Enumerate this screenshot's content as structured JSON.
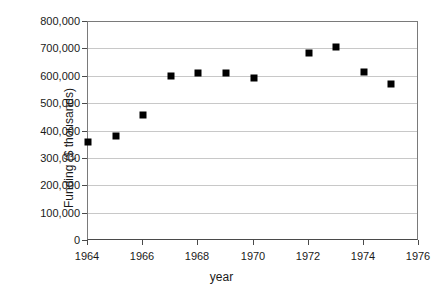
{
  "chart_data": {
    "type": "scatter",
    "title": "",
    "xlabel": "year",
    "ylabel": "Funding ($ thousands)",
    "xlim": [
      1964,
      1976
    ],
    "ylim": [
      0,
      800000
    ],
    "grid": "horizontal",
    "legend": "none",
    "marker": "filled-square",
    "marker_color": "#000000",
    "x": [
      1964,
      1965,
      1966,
      1967,
      1968,
      1969,
      1970,
      1972,
      1973,
      1974,
      1975
    ],
    "values": [
      363000,
      385000,
      462000,
      601000,
      614000,
      613000,
      596000,
      688000,
      708000,
      616000,
      573000
    ],
    "points": [
      {
        "x": 1964,
        "y": 363000
      },
      {
        "x": 1965,
        "y": 385000
      },
      {
        "x": 1966,
        "y": 462000
      },
      {
        "x": 1967,
        "y": 601000
      },
      {
        "x": 1968,
        "y": 614000
      },
      {
        "x": 1969,
        "y": 613000
      },
      {
        "x": 1970,
        "y": 596000
      },
      {
        "x": 1972,
        "y": 688000
      },
      {
        "x": 1973,
        "y": 708000
      },
      {
        "x": 1974,
        "y": 616000
      },
      {
        "x": 1975,
        "y": 573000
      }
    ],
    "ytick_values": [
      0,
      100000,
      200000,
      300000,
      400000,
      500000,
      600000,
      700000,
      800000
    ],
    "ytick_labels": [
      "0",
      "100,000",
      "200,000",
      "300,000",
      "400,000",
      "500,000",
      "600,000",
      "700,000",
      "800,000"
    ],
    "xtick_values": [
      1964,
      1966,
      1968,
      1970,
      1972,
      1974,
      1976
    ],
    "xtick_labels": [
      "1964",
      "1966",
      "1968",
      "1970",
      "1972",
      "1974",
      "1976"
    ]
  }
}
